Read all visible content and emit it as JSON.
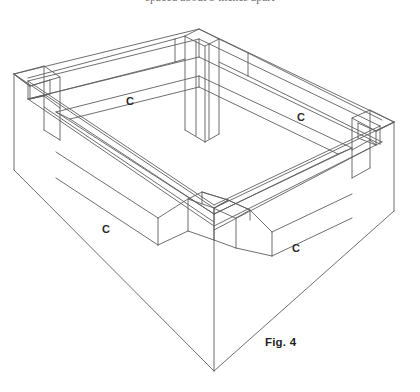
{
  "page": {
    "background_color": "#ffffff",
    "width": 420,
    "height": 392
  },
  "cropped_header_text": "spaced about 3 inches apart",
  "figure": {
    "caption": "Fig. 4",
    "caption_position": {
      "x": 265,
      "y": 337
    },
    "line_color": "#5f5f5f",
    "line_width": 0.9,
    "labels": [
      {
        "text": "C",
        "x": 126,
        "y": 96,
        "name": "corner-post-label-back-left"
      },
      {
        "text": "C",
        "x": 297,
        "y": 112,
        "name": "corner-post-label-back-right"
      },
      {
        "text": "C",
        "x": 102,
        "y": 224,
        "name": "corner-post-label-front-left"
      },
      {
        "text": "C",
        "x": 292,
        "y": 243,
        "name": "corner-post-label-front-right"
      }
    ]
  }
}
